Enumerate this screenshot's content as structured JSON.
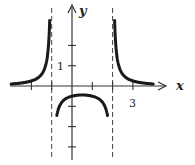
{
  "chart_data": {
    "type": "line",
    "title": "",
    "function": "y = 1/((x+1)(x-2))",
    "xlabel": "x",
    "ylabel": "y",
    "xlim": [
      -3,
      4
    ],
    "ylim": [
      -4,
      3.5
    ],
    "grid": false,
    "x_ticks": [
      -2,
      -1,
      1,
      2,
      3
    ],
    "y_ticks": [
      -3,
      -2,
      -1,
      1,
      2
    ],
    "tick_labels": [
      {
        "axis": "y",
        "value": 1,
        "text": "1"
      },
      {
        "axis": "x",
        "value": 3,
        "text": "3"
      }
    ],
    "vertical_asymptotes": [
      -1,
      2
    ],
    "horizontal_asymptote": 0,
    "series": [
      {
        "name": "left branch",
        "domain": [
          -3,
          -1.1
        ]
      },
      {
        "name": "middle branch",
        "domain": [
          -0.75,
          1.75
        ]
      },
      {
        "name": "right branch",
        "domain": [
          2.1,
          4
        ]
      }
    ],
    "colors": {
      "curve": "#1a1a1a",
      "axis": "#333333",
      "asymptote": "#444444"
    }
  },
  "labels": {
    "x_axis": "x",
    "y_axis": "y",
    "tick_y1": "1",
    "tick_x3": "3"
  }
}
